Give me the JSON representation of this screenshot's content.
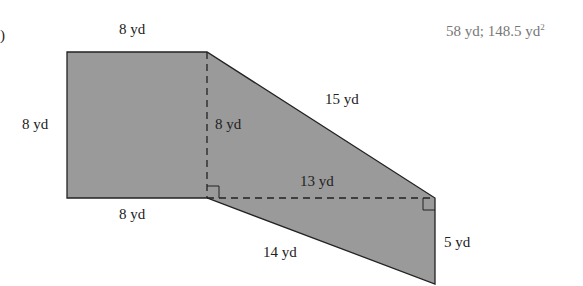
{
  "problem": {
    "label_partial": ")",
    "answer_perimeter": "58 yd; 148.5 yd",
    "answer_area_exp": "2"
  },
  "figure": {
    "fill_color": "#9a9a9a",
    "stroke_color": "#222222",
    "labels": {
      "top": "8 yd",
      "left": "8 yd",
      "bottom_left": "8 yd",
      "inner_height": "8 yd",
      "slant_top": "15 yd",
      "dashed_horizontal": "13 yd",
      "slant_bottom": "14 yd",
      "right_side": "5 yd"
    }
  }
}
